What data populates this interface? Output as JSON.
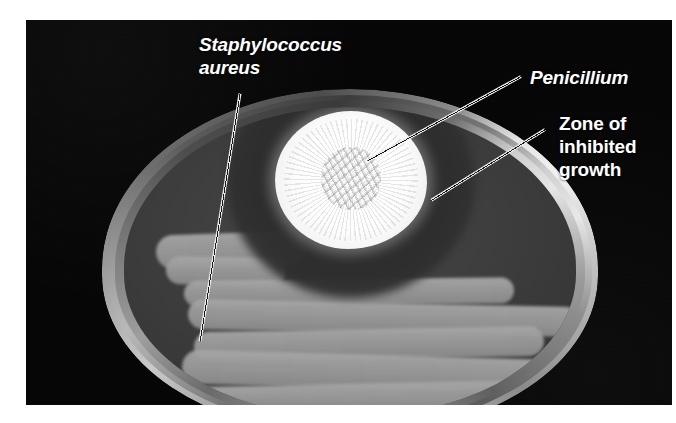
{
  "figure": {
    "kind": "photograph",
    "plate_background_color": "#060606",
    "page_background_color": "#ffffff"
  },
  "labels": [
    {
      "id": "staphylococcus-aureus",
      "text": "Staphylococcus\naureus",
      "style": "bold-italic",
      "color": "#ffffff",
      "x": 199,
      "y": 33,
      "points_to": "bacterial streaks (lawn) in lower-left of dish"
    },
    {
      "id": "penicillium",
      "text": "Penicillium",
      "style": "bold-italic",
      "color": "#ffffff",
      "x": 530,
      "y": 66,
      "points_to": "white fuzzy mold colony at top of dish"
    },
    {
      "id": "zone-of-inhibited-growth",
      "text": "Zone of\ninhibited\ngrowth",
      "style": "bold",
      "color": "#ffffff",
      "x": 559,
      "y": 112,
      "points_to": "clear dark halo surrounding the mold colony"
    }
  ],
  "leader_lines": [
    {
      "id": "leader-staphylococcus",
      "x1": 240,
      "y1": 92,
      "x2": 200,
      "y2": 340,
      "color": "#f0f0f0"
    },
    {
      "id": "leader-penicillium",
      "x1": 521,
      "y1": 75,
      "x2": 368,
      "y2": 159,
      "color": "#f0f0f0"
    },
    {
      "id": "leader-zone",
      "x1": 545,
      "y1": 128,
      "x2": 431,
      "y2": 199,
      "color": "#f0f0f0"
    }
  ],
  "dish": {
    "center_x": 324,
    "center_y": 261,
    "width": 496,
    "height": 345,
    "rim_color_light": "#e8e8e8",
    "rim_color_dark": "#3c3c3c",
    "agar_color": "#3d3d3d"
  },
  "penicillium_colony": {
    "center_x": 351,
    "center_y": 180,
    "width": 152,
    "height": 138,
    "color": "#ffffff"
  },
  "inhibition_zone": {
    "center_x": 351,
    "center_y": 182,
    "width": 248,
    "height": 232,
    "color": "#2e2e2e"
  },
  "bacterial_streaks": {
    "color_light": "#a6a6a6",
    "color_dark": "#8b8b8b",
    "count": 9,
    "pattern": "serpentine horizontal sweep",
    "segments": [
      {
        "x": 32,
        "y": 126,
        "w": 150,
        "h": 34,
        "rot": -2,
        "tone": "light"
      },
      {
        "x": 42,
        "y": 150,
        "w": 120,
        "h": 28,
        "rot": 1,
        "tone": "light"
      },
      {
        "x": 60,
        "y": 172,
        "w": 330,
        "h": 26,
        "rot": -0.6,
        "tone": "light"
      },
      {
        "x": 64,
        "y": 196,
        "w": 392,
        "h": 30,
        "rot": 1.2,
        "tone": "light"
      },
      {
        "x": 70,
        "y": 222,
        "w": 350,
        "h": 30,
        "rot": -1.0,
        "tone": "light"
      },
      {
        "x": 58,
        "y": 248,
        "w": 400,
        "h": 34,
        "rot": 1.6,
        "tone": "light"
      },
      {
        "x": 66,
        "y": 276,
        "w": 392,
        "h": 32,
        "rot": -1.2,
        "tone": "light"
      },
      {
        "x": 104,
        "y": 300,
        "w": 356,
        "h": 32,
        "rot": 2.0,
        "tone": "dark"
      },
      {
        "x": 140,
        "y": 322,
        "w": 300,
        "h": 28,
        "rot": -0.8,
        "tone": "dark"
      }
    ]
  }
}
